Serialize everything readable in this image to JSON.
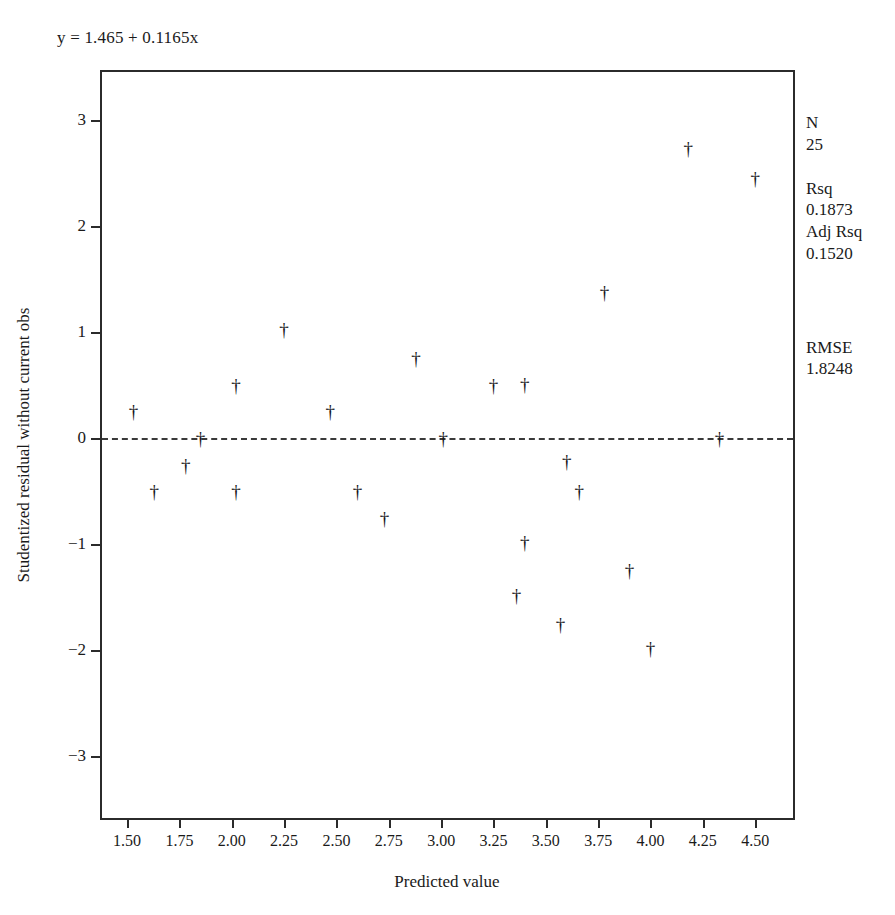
{
  "equation": "y = 1.465 + 0.1165x",
  "axis": {
    "x_title": "Predicted value",
    "y_title": "Studentized residual without current obs"
  },
  "stats": {
    "n_label": "N",
    "n_value": "25",
    "rsq_label": "Rsq",
    "rsq_value": "0.1873",
    "adj_rsq_label": "Adj Rsq",
    "adj_rsq_value": "0.1520",
    "rmse_label": "RMSE",
    "rmse_value": "1.8248"
  },
  "chart_data": {
    "type": "scatter",
    "title": "",
    "subtitle": "y = 1.465 + 0.1165x",
    "xlabel": "Predicted value",
    "ylabel": "Studentized residual without current obs",
    "xlim": [
      1.38,
      4.7
    ],
    "ylim": [
      -3.62,
      3.45
    ],
    "xticks": [
      1.5,
      1.75,
      2.0,
      2.25,
      2.5,
      2.75,
      3.0,
      3.25,
      3.5,
      3.75,
      4.0,
      4.25,
      4.5
    ],
    "xticklabels": [
      "1.50",
      "1.75",
      "2.00",
      "2.25",
      "2.50",
      "2.75",
      "3.00",
      "3.25",
      "3.50",
      "3.75",
      "4.00",
      "4.25",
      "4.50"
    ],
    "yticks": [
      3,
      2,
      1,
      0,
      -1,
      -2,
      -3
    ],
    "yticklabels": [
      "3",
      "2",
      "1",
      "0",
      "−1",
      "−2",
      "−3"
    ],
    "grid": false,
    "legend": false,
    "marker": "dagger",
    "reference_line": {
      "type": "horizontal",
      "y": 0,
      "style": "dashed"
    },
    "fit_line": {
      "intercept": 1.465,
      "slope": 0.1165,
      "drawn": false
    },
    "n_points": 25,
    "points": [
      {
        "x": 1.53,
        "y": 0.25
      },
      {
        "x": 1.63,
        "y": -0.5
      },
      {
        "x": 1.78,
        "y": -0.25
      },
      {
        "x": 1.85,
        "y": 0.0
      },
      {
        "x": 2.02,
        "y": 0.5
      },
      {
        "x": 2.02,
        "y": -0.5
      },
      {
        "x": 2.25,
        "y": 1.03
      },
      {
        "x": 2.47,
        "y": 0.25
      },
      {
        "x": 2.6,
        "y": -0.5
      },
      {
        "x": 2.73,
        "y": -0.75
      },
      {
        "x": 2.88,
        "y": 0.75
      },
      {
        "x": 3.01,
        "y": 0.0
      },
      {
        "x": 3.25,
        "y": 0.5
      },
      {
        "x": 3.4,
        "y": 0.51
      },
      {
        "x": 3.4,
        "y": -0.98
      },
      {
        "x": 3.36,
        "y": -1.48
      },
      {
        "x": 3.57,
        "y": -1.75
      },
      {
        "x": 3.6,
        "y": -0.22
      },
      {
        "x": 3.66,
        "y": -0.5
      },
      {
        "x": 3.78,
        "y": 1.38
      },
      {
        "x": 3.9,
        "y": -1.24
      },
      {
        "x": 4.0,
        "y": -1.98
      },
      {
        "x": 4.18,
        "y": 2.73
      },
      {
        "x": 4.33,
        "y": 0.0
      },
      {
        "x": 4.5,
        "y": 2.45
      }
    ],
    "annotations": [
      {
        "text": "N",
        "value": "25"
      },
      {
        "text": "Rsq",
        "value": "0.1873"
      },
      {
        "text": "Adj Rsq",
        "value": "0.1520"
      },
      {
        "text": "RMSE",
        "value": "1.8248"
      }
    ]
  }
}
